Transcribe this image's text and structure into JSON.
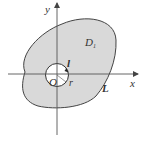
{
  "diagram": {
    "type": "region-with-hole",
    "axes": {
      "x_label": "x",
      "y_label": "y"
    },
    "labels": {
      "region": "D",
      "region_subscript": "1",
      "outer_curve": "L",
      "inner_curve": "l",
      "origin": "O",
      "radius": "r"
    },
    "colors": {
      "region_fill": "#d9d9d9",
      "stroke": "#444444",
      "hole_fill": "#ffffff",
      "axis": "#555555"
    }
  }
}
